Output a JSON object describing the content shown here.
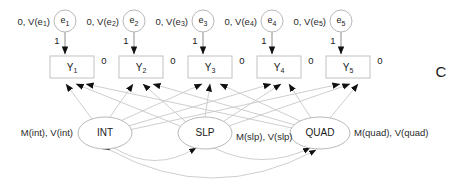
{
  "diagram": {
    "corner_label": "C",
    "background_color": "#ffffff",
    "line_color": "#c8c8c8",
    "text_color": "#1a1a1a"
  },
  "residuals": [
    {
      "id": "e1",
      "name": "e",
      "subscript": "1",
      "param_label": "0, V(e1)",
      "loading_label": "1",
      "cx": 65,
      "cy": 21
    },
    {
      "id": "e2",
      "name": "e",
      "subscript": "2",
      "param_label": "0, V(e2)",
      "loading_label": "1",
      "cx": 134,
      "cy": 21
    },
    {
      "id": "e3",
      "name": "e",
      "subscript": "3",
      "param_label": "0, V(e3)",
      "loading_label": "1",
      "cx": 203,
      "cy": 21
    },
    {
      "id": "e4",
      "name": "e",
      "subscript": "4",
      "param_label": "0, V(e4)",
      "loading_label": "1",
      "cx": 272,
      "cy": 21
    },
    {
      "id": "e5",
      "name": "e",
      "subscript": "5",
      "param_label": "0, V(e5)",
      "loading_label": "1",
      "cx": 341,
      "cy": 21
    }
  ],
  "indicators": [
    {
      "id": "Y1",
      "name": "Y",
      "subscript": "1",
      "intercept_label": "0",
      "cx": 72,
      "cy": 67
    },
    {
      "id": "Y2",
      "name": "Y",
      "subscript": "2",
      "intercept_label": "0",
      "cx": 141,
      "cy": 67
    },
    {
      "id": "Y3",
      "name": "Y",
      "subscript": "3",
      "intercept_label": "0",
      "cx": 210,
      "cy": 67
    },
    {
      "id": "Y4",
      "name": "Y",
      "subscript": "4",
      "intercept_label": "0",
      "cx": 279,
      "cy": 67
    },
    {
      "id": "Y5",
      "name": "Y",
      "subscript": "5",
      "intercept_label": "0",
      "cx": 348,
      "cy": 67
    }
  ],
  "latents": [
    {
      "id": "INT",
      "label": "INT",
      "param_label": "M(int), V(int)",
      "cx": 105,
      "cy": 133,
      "rx": 27,
      "ry": 16
    },
    {
      "id": "SLP",
      "label": "SLP",
      "param_label": "M(slp), V(slp)",
      "cx": 205,
      "cy": 133,
      "rx": 27,
      "ry": 16
    },
    {
      "id": "QUAD",
      "label": "QUAD",
      "param_label": "M(quad), V(quad)",
      "cx": 320,
      "cy": 133,
      "rx": 30,
      "ry": 16
    }
  ],
  "covariances": [
    {
      "id": "cov-int-slp",
      "from": "INT",
      "to": "SLP"
    },
    {
      "id": "cov-slp-quad",
      "from": "SLP",
      "to": "QUAD"
    },
    {
      "id": "cov-int-quad",
      "from": "INT",
      "to": "QUAD"
    }
  ]
}
